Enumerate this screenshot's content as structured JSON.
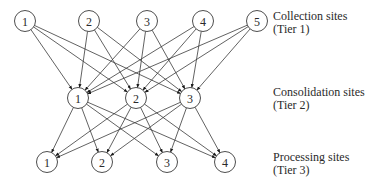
{
  "diagram": {
    "colors": {
      "stroke": "#3a3a3a",
      "text": "#2a2a2a",
      "background": "#ffffff"
    },
    "node_radius": 10.5,
    "tiers": [
      {
        "id": "tier1",
        "name": "Collection sites",
        "tier_label": "(Tier 1)",
        "label_y": 10,
        "nodes": [
          {
            "label": "1",
            "x": 25,
            "y": 21
          },
          {
            "label": "2",
            "x": 89,
            "y": 21
          },
          {
            "label": "3",
            "x": 147,
            "y": 21
          },
          {
            "label": "4",
            "x": 203,
            "y": 21
          },
          {
            "label": "5",
            "x": 257,
            "y": 21
          }
        ]
      },
      {
        "id": "tier2",
        "name": "Consolidation sites",
        "tier_label": "(Tier 2)",
        "label_y": 86,
        "nodes": [
          {
            "label": "1",
            "x": 78,
            "y": 98
          },
          {
            "label": "2",
            "x": 136,
            "y": 98
          },
          {
            "label": "3",
            "x": 190,
            "y": 98
          }
        ]
      },
      {
        "id": "tier3",
        "name": "Processing sites",
        "tier_label": "(Tier 3)",
        "label_y": 151,
        "nodes": [
          {
            "label": "1",
            "x": 47,
            "y": 162
          },
          {
            "label": "2",
            "x": 102,
            "y": 162
          },
          {
            "label": "3",
            "x": 167,
            "y": 162
          },
          {
            "label": "4",
            "x": 225,
            "y": 162
          }
        ]
      }
    ],
    "edges": [
      {
        "from": "tier1",
        "to": "tier2",
        "connectivity": "complete",
        "count": 15
      },
      {
        "from": "tier2",
        "to": "tier3",
        "connectivity": "complete",
        "count": 12
      }
    ]
  }
}
